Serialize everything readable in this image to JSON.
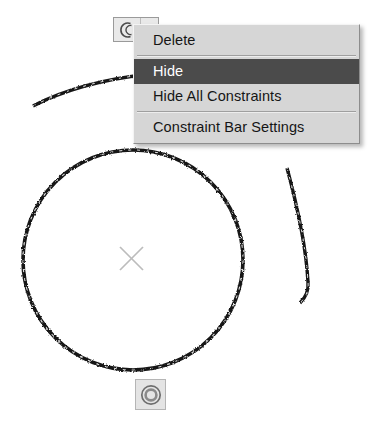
{
  "application": {
    "context": "cad-drawing-canvas",
    "background_color": "#ffffff"
  },
  "drawing": {
    "ink_color": "#1a1a1a",
    "marker_color": "#b8b8b8",
    "entities": [
      {
        "name": "main-circle",
        "type": "circle",
        "cx": 133,
        "cy": 260,
        "r": 110
      },
      {
        "name": "upper-arc",
        "type": "arc"
      },
      {
        "name": "right-arc",
        "type": "arc"
      }
    ],
    "center_marker": {
      "name": "center-point-marker",
      "glyph": "x-marker",
      "cx": 131,
      "cy": 258
    }
  },
  "constraint_bar": {
    "glyph_icon": "tangent-constraint-icon",
    "chevron_icon": "chevron-down-icon",
    "background_color": "#e9e9e9"
  },
  "constraint_icon": {
    "glyph_icon": "concentric-constraint-icon",
    "background_color": "#e4e4e4"
  },
  "context_menu": {
    "background_color": "#d6d6d6",
    "highlight_color": "#4b4b4b",
    "highlight_text_color": "#ffffff",
    "items": [
      {
        "label": "Delete",
        "selected": false
      },
      {
        "label": "Hide",
        "selected": true
      },
      {
        "label": "Hide All Constraints",
        "selected": false
      },
      {
        "label": "Constraint Bar Settings",
        "selected": false
      }
    ]
  }
}
